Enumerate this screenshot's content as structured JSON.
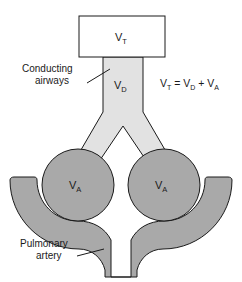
{
  "figure": {
    "background_color": "#ffffff"
  },
  "colors": {
    "airway_fill": "#e2e2e2",
    "alveolus_fill": "#a9a9a9",
    "artery_fill": "#a9a9a9",
    "box_fill": "#ffffff",
    "stroke": "#1a1a1a",
    "text": "#1a1a1a"
  },
  "labels": {
    "tidal_volume": {
      "symbol": "V",
      "subscript": "T",
      "name": "tidal-volume-label"
    },
    "dead_space": {
      "symbol": "V",
      "subscript": "D",
      "name": "dead-space-label"
    },
    "alveolar_left": {
      "symbol": "V",
      "subscript": "A",
      "name": "alveolar-volume-left-label"
    },
    "alveolar_right": {
      "symbol": "V",
      "subscript": "A",
      "name": "alveolar-volume-right-label"
    },
    "conducting_airways": {
      "line1": "Conducting",
      "line2": "airways"
    },
    "pulmonary_artery": {
      "line1": "Pulmonary",
      "line2": "artery"
    }
  },
  "equation": {
    "lhs_symbol": "V",
    "lhs_sub": "T",
    "equals": "=",
    "term1_symbol": "V",
    "term1_sub": "D",
    "plus": "+",
    "term2_symbol": "V",
    "term2_sub": "A",
    "full_text": "VT = VD + VA"
  }
}
